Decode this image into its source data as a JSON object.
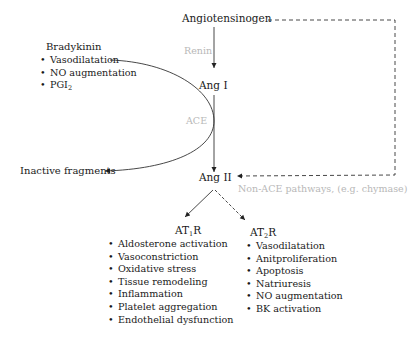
{
  "diagram": {
    "nodes": {
      "angiotensinogen": "Angiotensinogen",
      "ang1": "Ang I",
      "ang2": "Ang II",
      "inactive_fragments": "Inactive fragments"
    },
    "enzymes": {
      "renin": "Renin",
      "ace": "ACE",
      "non_ace": "Non-ACE pathways, (e.g. chymase)"
    },
    "bradykinin": {
      "title": "Bradykinin",
      "items": [
        "Vasodilatation",
        "NO augmentation",
        "PGI"
      ],
      "pgi_subscript": "2"
    },
    "at1r": {
      "prefix": "AT",
      "subscript": "1",
      "suffix": "R",
      "items": [
        "Aldosterone activation",
        "Vasoconstriction",
        "Oxidative stress",
        "Tissue remodeling",
        "Inflammation",
        "Platelet aggregation",
        "Endothelial dysfunction"
      ]
    },
    "at2r": {
      "prefix": "AT",
      "subscript": "2",
      "suffix": "R",
      "items": [
        "Vasodilatation",
        "Anitproliferation",
        "Apoptosis",
        "Natriuresis",
        "NO augmentation",
        "BK activation"
      ]
    },
    "colors": {
      "text": "#1a1a1a",
      "enzyme_label": "#b8b8b8",
      "line": "#333333"
    }
  }
}
